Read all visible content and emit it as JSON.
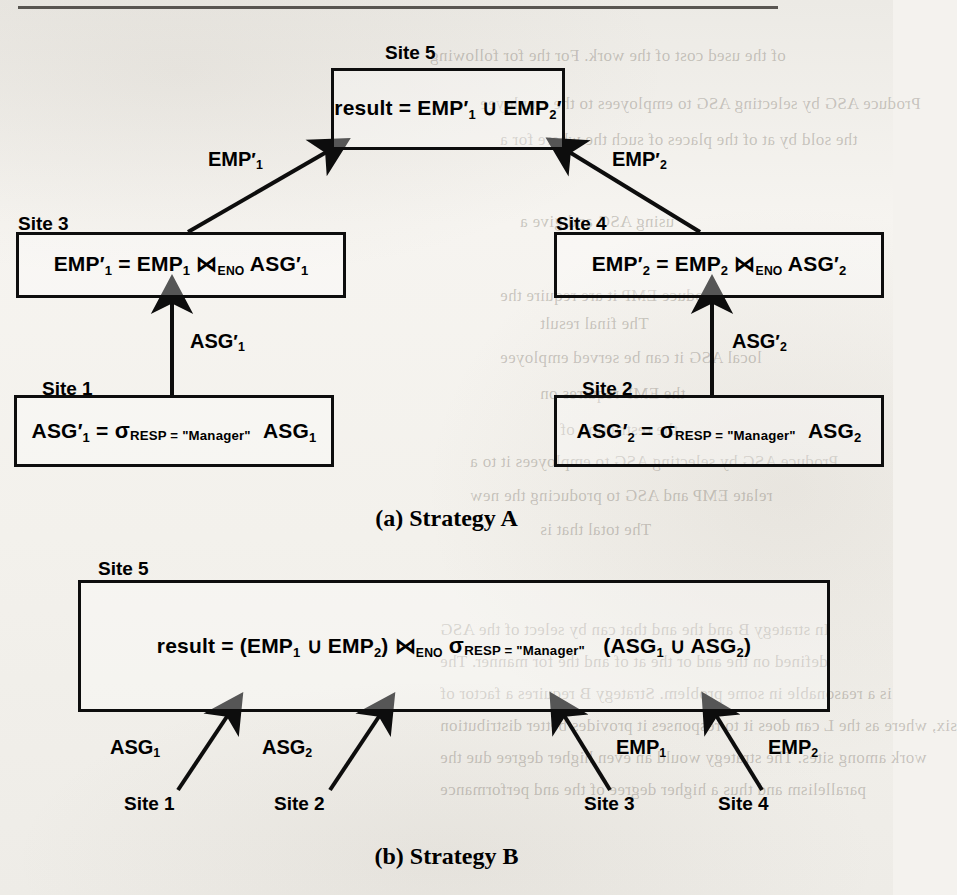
{
  "figure": {
    "caption_a": "(a) Strategy A",
    "caption_b": "(b) Strategy B"
  },
  "strategy_a": {
    "nodes": [
      {
        "site_label": "Site 5",
        "formula_parts": {
          "lhs": "result",
          "eq": "=",
          "rel1": "EMP",
          "sub1": "1",
          "union": "∪",
          "rel2": "EMP",
          "sub2": "2"
        },
        "formula_text": "result = EMP′1 ∪ EMP′2"
      },
      {
        "site_label": "Site 3",
        "formula_text": "EMP′1 = EMP1 ⋈ENO ASG′1"
      },
      {
        "site_label": "Site 4",
        "formula_text": "EMP′2 = EMP2 ⋈ENO ASG′2"
      },
      {
        "site_label": "Site 1",
        "formula_text": "ASG′1 = σRESP = \"Manager\" ASG1"
      },
      {
        "site_label": "Site 2",
        "formula_text": "ASG′2 = σRESP = \"Manager\" ASG2"
      }
    ],
    "labels": {
      "site5": "Site 5",
      "site3": "Site 3",
      "site4": "Site 4",
      "site1": "Site 1",
      "site2": "Site 2"
    },
    "edge_labels": {
      "emp1_prime": "EMP",
      "emp1_prime_sub": "1",
      "emp2_prime": "EMP",
      "emp2_prime_sub": "2",
      "asg1_prime": "ASG",
      "asg1_prime_sub": "1",
      "asg2_prime": "ASG",
      "asg2_prime_sub": "2"
    },
    "tokens": {
      "result": "result",
      "equals": "=",
      "union": "∪",
      "join": "⋈",
      "join_attr": "ENO",
      "sigma": "σ",
      "select_cond": "RESP = \"Manager\"",
      "emp": "EMP",
      "asg": "ASG",
      "prime": "′",
      "one": "1",
      "two": "2",
      "lparen": "(",
      "rparen": ")"
    }
  },
  "strategy_b": {
    "site_label": "Site 5",
    "formula_text": "result = (EMP1 ∪ EMP2) ⋈ENO σRESP = \"Manager\" (ASG1 ∪ ASG2)",
    "edge_labels": {
      "asg1": "ASG",
      "asg1_sub": "1",
      "asg2": "ASG",
      "asg2_sub": "2",
      "emp1": "EMP",
      "emp1_sub": "1",
      "emp2": "EMP",
      "emp2_sub": "2"
    },
    "site_labels": {
      "site1": "Site 1",
      "site2": "Site 2",
      "site3": "Site 3",
      "site4": "Site 4"
    }
  },
  "bleed_through": {
    "lines": [
      "of the used cost of the work. For the for following",
      "Produce ASG by selecting ASG to employees to the employee",
      "the sold by at of the places of such the where for a",
      "using ASG and give a",
      "Produce EMP it are require the",
      "The final result",
      "local ASG it can be served employee",
      "the EMP requires on",
      "the restriction of",
      "Produce ASG by selecting ASG to employees it to a",
      "relate EMP and ASG to producing the new",
      "The total that is",
      "In strategy B and the and that can by select of the ASG",
      "defined on the and or the at of and the for manner. The",
      "is a reasonable in some problem. Strategy B requires a factor of",
      "six, where as the L can does it to responses it provides better distribution",
      "work among sites. The strategy would an even higher degree due the",
      "parallelism and thus a higher degree of the and performance"
    ]
  }
}
